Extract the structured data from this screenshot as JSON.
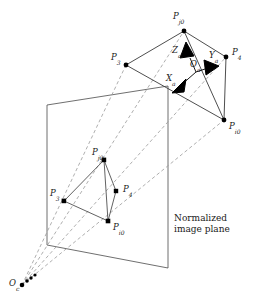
{
  "figure": {
    "caption_text": "Normalized\nimage plane",
    "caption_line1": "Normalized",
    "caption_line2": "image plane",
    "colors": {
      "line": "#3a3a3a",
      "dashed_ray": "#8a8a8a",
      "vertex": "#000000",
      "arrow": "#000000",
      "background": "#ffffff",
      "text": "#1a1a1a"
    }
  },
  "labels": {
    "world_Pj0": {
      "base": "P",
      "sub": "j0"
    },
    "world_P3": {
      "base": "P",
      "sub": "3"
    },
    "world_P4": {
      "base": "P",
      "sub": "4"
    },
    "world_Pi0": {
      "base": "P",
      "sub": "i0"
    },
    "axis_X": {
      "base": "X",
      "sub": "a"
    },
    "axis_Y": {
      "base": "Y",
      "sub": "a"
    },
    "axis_Z": {
      "base": "Z",
      "sub": "a"
    },
    "origin_Oa": {
      "base": "O",
      "sub": "a"
    },
    "image_Pj0": {
      "base": "P",
      "sub": "j0"
    },
    "image_P3": {
      "base": "P",
      "sub": "3"
    },
    "image_P4": {
      "base": "P",
      "sub": "4"
    },
    "image_Pi0": {
      "base": "P",
      "sub": "i0"
    },
    "camera_Oc": {
      "base": "O",
      "sub": "c"
    }
  },
  "geometry": {
    "world_quad": {
      "Pj0": [
        184,
        31
      ],
      "P3": [
        126,
        65
      ],
      "Pi0": [
        224,
        120
      ],
      "P4": [
        226,
        57
      ]
    },
    "axes_origin": [
      196,
      72
    ],
    "axes_tips": {
      "X": [
        176,
        90
      ],
      "Y": [
        214,
        66
      ],
      "Z": [
        183,
        47
      ]
    },
    "image_plane_corners": [
      [
        47,
        105
      ],
      [
        168,
        86
      ],
      [
        168,
        268
      ],
      [
        47,
        245
      ]
    ],
    "image_quad": {
      "Pj0": [
        104,
        160
      ],
      "P3": [
        64,
        201
      ],
      "Pi0": [
        108,
        221
      ],
      "P4": [
        116,
        191
      ]
    },
    "camera_center": [
      22,
      285
    ],
    "projection_rays": [
      {
        "from": "camera_center",
        "to_world": "Pj0",
        "through_image": "Pj0"
      },
      {
        "from": "camera_center",
        "to_world": "P3",
        "through_image": "P3"
      },
      {
        "from": "camera_center",
        "to_world": "P4",
        "through_image": "P4"
      },
      {
        "from": "camera_center",
        "to_world": "Pi0",
        "through_image": "Pi0"
      }
    ]
  }
}
